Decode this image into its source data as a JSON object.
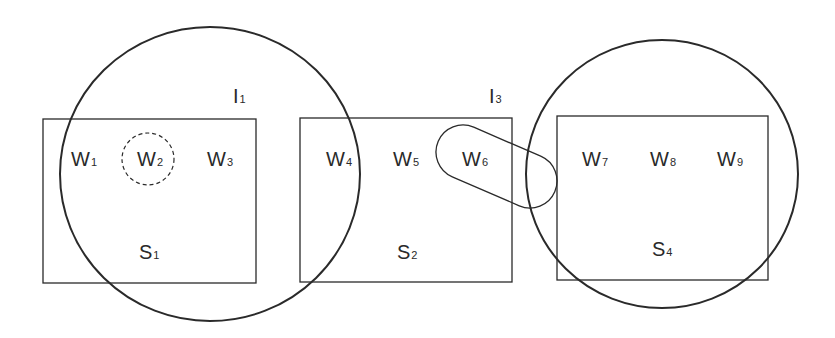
{
  "diagram": {
    "colors": {
      "stroke": "#2a2a2a",
      "background": "#ffffff"
    },
    "boxes": [
      {
        "id": "S1",
        "label": "S",
        "sub": "1",
        "x": 43,
        "y": 119,
        "w": 213,
        "h": 164,
        "label_x": 139,
        "label_y": 259
      },
      {
        "id": "S2",
        "label": "S",
        "sub": "2",
        "x": 300,
        "y": 118,
        "w": 212,
        "h": 164,
        "label_x": 397,
        "label_y": 259
      },
      {
        "id": "S4",
        "label": "S",
        "sub": "4",
        "x": 557,
        "y": 116,
        "w": 211,
        "h": 164,
        "label_x": 652,
        "label_y": 256
      }
    ],
    "circles": [
      {
        "id": "I1",
        "label": "I",
        "sub": "1",
        "cx": 210,
        "cy": 174,
        "rx": 150,
        "ry": 147,
        "label_x": 233,
        "label_y": 103
      },
      {
        "id": "I3",
        "label": "I",
        "sub": "3",
        "cx": 662,
        "cy": 174,
        "rx": 136,
        "ry": 134,
        "label_x": 489,
        "label_y": 103
      }
    ],
    "words": [
      {
        "id": "W1",
        "label": "W",
        "sub": "1",
        "x": 71,
        "y": 166
      },
      {
        "id": "W2",
        "label": "W",
        "sub": "2",
        "x": 137,
        "y": 166
      },
      {
        "id": "W3",
        "label": "W",
        "sub": "3",
        "x": 207,
        "y": 166
      },
      {
        "id": "W4",
        "label": "W",
        "sub": "4",
        "x": 326,
        "y": 166
      },
      {
        "id": "W5",
        "label": "W",
        "sub": "5",
        "x": 393,
        "y": 166
      },
      {
        "id": "W6",
        "label": "W",
        "sub": "6",
        "x": 462,
        "y": 166
      },
      {
        "id": "W7",
        "label": "W",
        "sub": "7",
        "x": 582,
        "y": 166
      },
      {
        "id": "W8",
        "label": "W",
        "sub": "8",
        "x": 650,
        "y": 166
      },
      {
        "id": "W9",
        "label": "W",
        "sub": "9",
        "x": 717,
        "y": 166
      }
    ],
    "dashed_circle": {
      "around": "W2",
      "cx": 148,
      "cy": 159,
      "r": 26
    },
    "capsule": {
      "around": "W6",
      "x1": 463,
      "y1": 152,
      "x2": 530,
      "y2": 181,
      "r": 27
    }
  }
}
